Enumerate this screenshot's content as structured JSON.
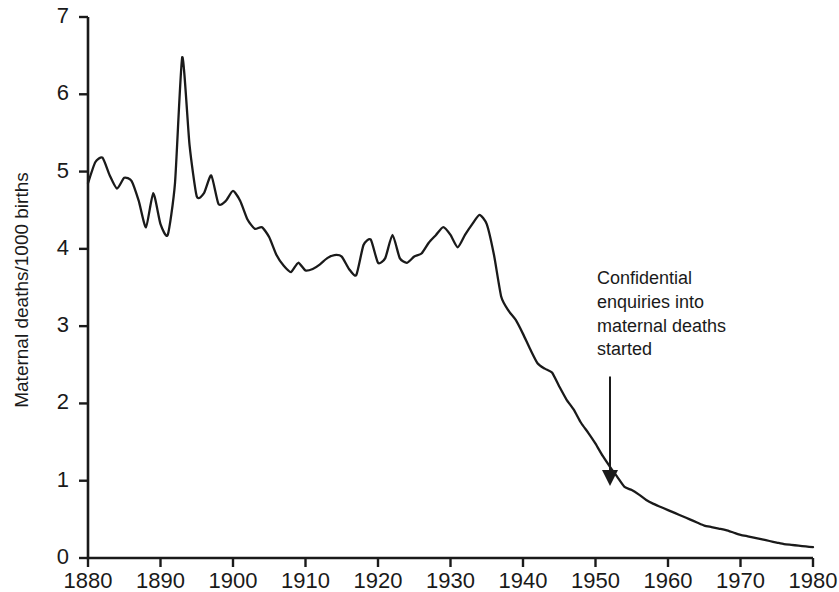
{
  "chart_data": {
    "type": "line",
    "title": "",
    "xlabel": "",
    "ylabel": "Maternal deaths/1000 births",
    "xlim": [
      1880,
      1980
    ],
    "ylim": [
      0,
      7
    ],
    "grid": false,
    "legend": null,
    "xticks": [
      1880,
      1890,
      1900,
      1910,
      1920,
      1930,
      1940,
      1950,
      1960,
      1970,
      1980
    ],
    "yticks": [
      0,
      1,
      2,
      3,
      4,
      5,
      6,
      7
    ],
    "xtick_labels": [
      "1880",
      "1890",
      "1900",
      "1910",
      "1920",
      "1930",
      "1940",
      "1950",
      "1960",
      "1970",
      "1980"
    ],
    "ytick_labels": [
      "0",
      "1",
      "2",
      "3",
      "4",
      "5",
      "6",
      "7"
    ],
    "series": [
      {
        "name": "Maternal mortality rate",
        "x": [
          1880,
          1881,
          1882,
          1883,
          1884,
          1885,
          1886,
          1887,
          1888,
          1889,
          1890,
          1891,
          1892,
          1893,
          1894,
          1895,
          1896,
          1897,
          1898,
          1899,
          1900,
          1901,
          1902,
          1903,
          1904,
          1905,
          1906,
          1907,
          1908,
          1909,
          1910,
          1911,
          1912,
          1913,
          1914,
          1915,
          1916,
          1917,
          1918,
          1919,
          1920,
          1921,
          1922,
          1923,
          1924,
          1925,
          1926,
          1927,
          1928,
          1929,
          1930,
          1931,
          1932,
          1933,
          1934,
          1935,
          1936,
          1937,
          1938,
          1939,
          1940,
          1941,
          1942,
          1943,
          1944,
          1945,
          1946,
          1947,
          1948,
          1949,
          1950,
          1951,
          1952,
          1953,
          1954,
          1955,
          1956,
          1957,
          1958,
          1959,
          1960,
          1961,
          1962,
          1963,
          1964,
          1965,
          1966,
          1967,
          1968,
          1969,
          1970,
          1971,
          1972,
          1973,
          1974,
          1975,
          1976,
          1977,
          1978,
          1979,
          1980
        ],
        "values": [
          4.85,
          5.12,
          5.18,
          4.95,
          4.78,
          4.92,
          4.88,
          4.62,
          4.28,
          4.72,
          4.32,
          4.18,
          4.85,
          6.48,
          5.35,
          4.68,
          4.72,
          4.95,
          4.58,
          4.62,
          4.75,
          4.62,
          4.38,
          4.26,
          4.28,
          4.15,
          3.92,
          3.78,
          3.7,
          3.82,
          3.72,
          3.74,
          3.8,
          3.88,
          3.92,
          3.9,
          3.74,
          3.66,
          4.05,
          4.12,
          3.82,
          3.88,
          4.18,
          3.88,
          3.82,
          3.9,
          3.94,
          4.08,
          4.18,
          4.28,
          4.18,
          4.02,
          4.18,
          4.32,
          4.44,
          4.32,
          3.92,
          3.38,
          3.2,
          3.08,
          2.9,
          2.7,
          2.52,
          2.45,
          2.4,
          2.22,
          2.05,
          1.92,
          1.75,
          1.62,
          1.48,
          1.32,
          1.18,
          1.05,
          0.92,
          0.88,
          0.82,
          0.75,
          0.7,
          0.66,
          0.62,
          0.58,
          0.54,
          0.5,
          0.46,
          0.42,
          0.4,
          0.38,
          0.36,
          0.33,
          0.3,
          0.28,
          0.26,
          0.24,
          0.22,
          0.2,
          0.18,
          0.17,
          0.16,
          0.15,
          0.14
        ]
      }
    ],
    "annotations": [
      {
        "text": "Confidential\nenquiries into\nmaternal deaths\nstarted",
        "arrow_x": 1952,
        "arrow_y": 0.92,
        "arrow_from_y": 2.35
      }
    ],
    "line_color": "#1a1a1a",
    "axis_color": "#1a1a1a",
    "background_color": "#ffffff"
  }
}
